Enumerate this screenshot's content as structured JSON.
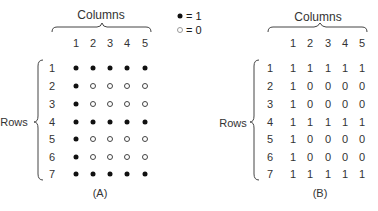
{
  "legend": {
    "filled_label": "• = 1",
    "filled_value": "= 1",
    "hollow_value": "= 0"
  },
  "panel_a": {
    "columns_label": "Columns",
    "rows_label": "Rows",
    "caption": "(A)",
    "column_numbers": [
      "1",
      "2",
      "3",
      "4",
      "5"
    ],
    "row_numbers": [
      "1",
      "2",
      "3",
      "4",
      "5",
      "6",
      "7"
    ],
    "matrix": [
      [
        1,
        1,
        1,
        1,
        1
      ],
      [
        1,
        0,
        0,
        0,
        0
      ],
      [
        1,
        0,
        0,
        0,
        0
      ],
      [
        1,
        1,
        1,
        1,
        1
      ],
      [
        1,
        0,
        0,
        0,
        0
      ],
      [
        1,
        0,
        0,
        0,
        0
      ],
      [
        1,
        1,
        1,
        1,
        1
      ]
    ]
  },
  "panel_b": {
    "columns_label": "Columns",
    "rows_label": "Rows",
    "caption": "(B)",
    "column_numbers": [
      "1",
      "2",
      "3",
      "4",
      "5"
    ],
    "row_numbers": [
      "1",
      "2",
      "3",
      "4",
      "5",
      "6",
      "7"
    ],
    "matrix": [
      [
        "1",
        "1",
        "1",
        "1",
        "1"
      ],
      [
        "1",
        "0",
        "0",
        "0",
        "0"
      ],
      [
        "1",
        "0",
        "0",
        "0",
        "0"
      ],
      [
        "1",
        "1",
        "1",
        "1",
        "1"
      ],
      [
        "1",
        "0",
        "0",
        "0",
        "0"
      ],
      [
        "1",
        "0",
        "0",
        "0",
        "0"
      ],
      [
        "1",
        "1",
        "1",
        "1",
        "1"
      ]
    ]
  }
}
